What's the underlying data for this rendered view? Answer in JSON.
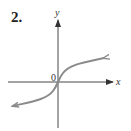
{
  "problem": {
    "number": "2."
  },
  "graph": {
    "x_axis_label": "x",
    "y_axis_label": "y",
    "origin_label": "0",
    "curve_color": "#8a8a8a",
    "axis_color": "#333333",
    "curve_description": "increasing S-shaped curve through origin (cube-root-like), arrows at both ends"
  }
}
